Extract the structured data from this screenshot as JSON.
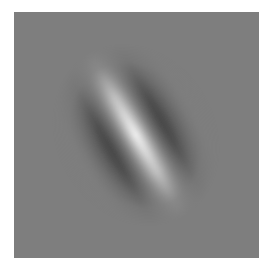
{
  "image": {
    "description": "Gabor patch: oriented sinusoidal grating windowed by a Gaussian on a mid-grey square",
    "background_color": "#7e7e7e",
    "page_color": "#ffffff",
    "stimulus": {
      "type": "gabor-patch",
      "orientation_deg": -30,
      "center_stripe": "bright",
      "flank_stripes": "dark",
      "light_color": "#ffffff",
      "dark_color": "#2a2a2a"
    }
  }
}
